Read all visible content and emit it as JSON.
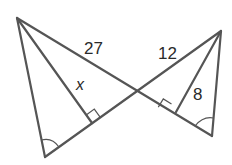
{
  "diagram": {
    "title": "",
    "labels": {
      "left_side": "27",
      "right_side": "12",
      "left_altitude": "x",
      "right_altitude": "8"
    },
    "markers": {
      "right_angle_left": "right-angle",
      "right_angle_right": "right-angle",
      "angle_arc_left": "congruent-angle",
      "angle_arc_right": "congruent-angle"
    },
    "colors": {
      "stroke": "#555555",
      "text": "#2a2a2a",
      "background": "#ffffff"
    }
  }
}
